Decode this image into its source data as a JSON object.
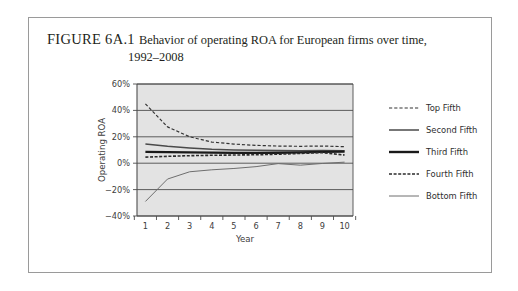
{
  "figure": {
    "label": "FIGURE 6A.1",
    "caption_line1": "Behavior of operating ROA for European firms over time,",
    "caption_line2": "1992–2008"
  },
  "colors": {
    "plot_background": "#e3e3e3",
    "gridline": "#4d4d4d",
    "axis": "#4d4d4d",
    "frame_border": "#9a9a9a",
    "series_top": "#333333",
    "series_second": "#4a4a4a",
    "series_third": "#1a1a1a",
    "series_fourth": "#2b2b2b",
    "series_bottom": "#6e6e6e",
    "text": "#3d3d3d"
  },
  "chart_data": {
    "type": "line",
    "title": "Behavior of operating ROA for European firms over time, 1992–2008",
    "xlabel": "Year",
    "ylabel": "Operating ROA",
    "x": [
      1,
      2,
      3,
      4,
      5,
      6,
      7,
      8,
      9,
      10
    ],
    "xlim": [
      0.62,
      10.38
    ],
    "ylim": [
      -40,
      60
    ],
    "xticks": [
      1,
      2,
      3,
      4,
      5,
      6,
      7,
      8,
      9,
      10
    ],
    "xtick_labels": [
      "1",
      "2",
      "3",
      "4",
      "5",
      "6",
      "7",
      "8",
      "9",
      "10"
    ],
    "yticks": [
      -40,
      -20,
      0,
      20,
      40,
      60
    ],
    "ytick_labels": [
      "−40%",
      "−20%",
      "0%",
      "20%",
      "40%",
      "60%"
    ],
    "grid": "horizontal",
    "legend_position": "right",
    "series": [
      {
        "name": "Top Fifth",
        "style": "dashed",
        "width": 1.2,
        "color": "#333333",
        "values": [
          45.0,
          27.5,
          20.0,
          16.0,
          14.5,
          13.5,
          13.0,
          12.8,
          13.0,
          12.5
        ]
      },
      {
        "name": "Second Fifth",
        "style": "solid",
        "width": 1.5,
        "color": "#4a4a4a",
        "values": [
          14.5,
          12.8,
          11.5,
          10.5,
          10.0,
          9.8,
          9.6,
          9.5,
          9.6,
          9.5
        ]
      },
      {
        "name": "Third Fifth",
        "style": "solid",
        "width": 2.4,
        "color": "#1a1a1a",
        "values": [
          8.6,
          8.4,
          8.2,
          8.0,
          7.8,
          7.8,
          7.9,
          8.2,
          8.6,
          8.8
        ]
      },
      {
        "name": "Fourth Fifth",
        "style": "dashed",
        "width": 1.6,
        "color": "#2b2b2b",
        "values": [
          4.6,
          5.2,
          5.7,
          6.0,
          6.2,
          6.4,
          6.8,
          7.4,
          8.0,
          6.2
        ]
      },
      {
        "name": "Bottom Fifth",
        "style": "solid",
        "width": 1.0,
        "color": "#6e6e6e",
        "values": [
          -29.0,
          -12.0,
          -6.5,
          -5.0,
          -4.0,
          -2.6,
          -0.3,
          -1.5,
          -0.2,
          0.8
        ]
      }
    ]
  }
}
